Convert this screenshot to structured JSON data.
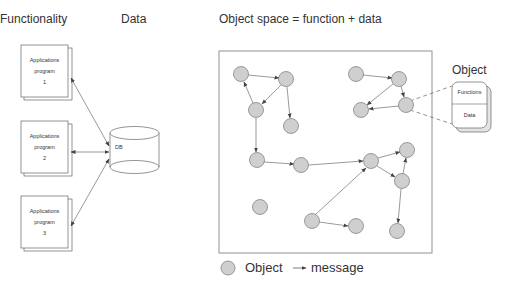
{
  "headings": {
    "functionality": "Functionality",
    "data": "Data",
    "object_space": "Object space = function + data",
    "object": "Object"
  },
  "programs": [
    {
      "line1": "Applications",
      "line2": "program",
      "line3": "1"
    },
    {
      "line1": "Applications",
      "line2": "program",
      "line3": "2"
    },
    {
      "line1": "Applications",
      "line2": "program",
      "line3": "3"
    }
  ],
  "database": {
    "label": "DB"
  },
  "object_card": {
    "top": "Functions",
    "bottom": "Data"
  },
  "legend": {
    "object": "Object",
    "message": "message"
  },
  "colors": {
    "node_fill": "#cfcfcf",
    "node_stroke": "#777777",
    "line": "#555555"
  }
}
